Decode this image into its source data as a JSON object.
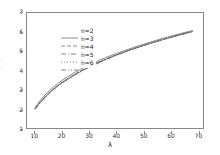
{
  "chart_data": {
    "type": "line",
    "title": "",
    "xlabel": "λ",
    "ylabel": "E[C]",
    "xlim": [
      7,
      72
    ],
    "ylim": [
      1,
      7
    ],
    "xticks": [
      10,
      20,
      30,
      40,
      50,
      60,
      70
    ],
    "yticks": [
      1,
      2,
      3,
      4,
      5,
      6,
      7
    ],
    "grid": false,
    "legend_position": "upper left",
    "x": [
      10,
      12,
      14,
      16,
      18,
      20,
      24,
      28,
      32,
      36,
      40,
      44,
      48,
      52,
      56,
      60,
      64,
      68
    ],
    "series": [
      {
        "name": "n=2",
        "linestyle": "solid",
        "color": "#707070",
        "values": [
          2.08,
          2.46,
          2.78,
          3.05,
          3.28,
          3.49,
          3.85,
          4.16,
          4.43,
          4.67,
          4.89,
          5.09,
          5.28,
          5.46,
          5.63,
          5.79,
          5.94,
          6.08
        ]
      },
      {
        "name": "n=3",
        "linestyle": "dashed",
        "color": "#6e6e6e",
        "values": [
          2.02,
          2.38,
          2.69,
          2.96,
          3.19,
          3.4,
          3.76,
          4.08,
          4.35,
          4.6,
          4.83,
          5.04,
          5.23,
          5.41,
          5.58,
          5.74,
          5.9,
          6.04
        ]
      },
      {
        "name": "n=4",
        "linestyle": "dashdot",
        "color": "#6c6c6c",
        "values": [
          2.0,
          2.35,
          2.66,
          2.93,
          3.16,
          3.37,
          3.73,
          4.05,
          4.33,
          4.58,
          4.81,
          5.02,
          5.21,
          5.4,
          5.57,
          5.73,
          5.88,
          6.03
        ]
      },
      {
        "name": "n=5",
        "linestyle": "dotted",
        "color": "#6a6a6a",
        "values": [
          1.99,
          2.34,
          2.65,
          2.92,
          3.15,
          3.36,
          3.72,
          4.04,
          4.32,
          4.57,
          4.8,
          5.01,
          5.21,
          5.39,
          5.56,
          5.72,
          5.88,
          6.02
        ]
      },
      {
        "name": "n=6",
        "linestyle": "dashdotdot",
        "color": "#686868",
        "values": [
          1.98,
          2.33,
          2.64,
          2.91,
          3.14,
          3.35,
          3.71,
          4.03,
          4.31,
          4.56,
          4.79,
          5.01,
          5.2,
          5.38,
          5.55,
          5.72,
          5.87,
          6.02
        ]
      }
    ]
  },
  "legend": {
    "entries": [
      {
        "label": "n=2"
      },
      {
        "label": "n=3"
      },
      {
        "label": "n=4"
      },
      {
        "label": "n=5"
      },
      {
        "label": "n=6"
      }
    ]
  },
  "axes": {
    "y_label": "E[C]",
    "x_label": "λ",
    "y_tick_labels": [
      "7",
      "6",
      "5",
      "4",
      "3",
      "2",
      "1"
    ],
    "x_tick_labels": [
      "10",
      "20",
      "30",
      "40",
      "50",
      "60",
      "70"
    ]
  },
  "colors": {
    "frame": "#888888",
    "line": "#6e6e6e",
    "text": "#222222"
  }
}
